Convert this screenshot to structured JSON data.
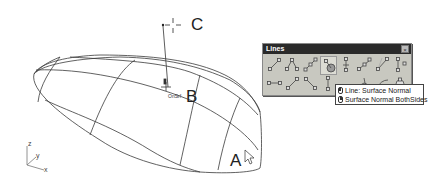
{
  "viewport": {
    "point_labels": {
      "a": "A",
      "b": "B",
      "c": "C"
    },
    "snap_label": "OnSrf",
    "axes": {
      "z": "z",
      "y": "y",
      "x": "x"
    }
  },
  "toolbar": {
    "title": "Lines",
    "close_glyph": "×",
    "buttons": [
      {
        "name": "line-two-points"
      },
      {
        "name": "polyline"
      },
      {
        "name": "line-segments"
      },
      {
        "name": "line-surface-normal",
        "hover": true
      },
      {
        "name": "line-vertical"
      },
      {
        "name": "line-from-midpoint"
      },
      {
        "name": "line-angled"
      },
      {
        "name": "line-perpendicular"
      },
      {
        "name": "line-horizontal"
      },
      {
        "name": "line-bisector"
      },
      {
        "name": "line-tangent"
      },
      {
        "name": "line-vertical-to-cplane"
      },
      {
        "name": "line-tangent-two-curves"
      },
      {
        "name": "line-perp-two-curves"
      },
      {
        "name": "line-extend"
      },
      {
        "name": "line-fit-points"
      }
    ]
  },
  "tooltip": {
    "left_click": "Line: Surface Normal",
    "right_click": "Surface Normal BothSides"
  },
  "colors": {
    "wire": "#3a3a3a",
    "toolbar_bg": "#c8c8c0",
    "titlebar_bg": "#2a2a2a"
  }
}
